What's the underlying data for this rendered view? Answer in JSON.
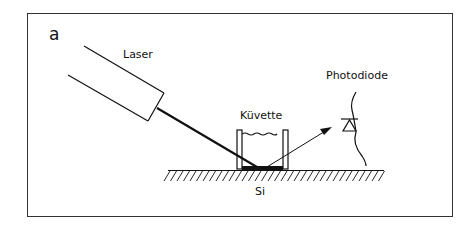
{
  "panel_label": "a",
  "labels": {
    "laser": "Laser",
    "cuvette": "Küvette",
    "photodiode": "Photodiode",
    "substrate": "Si"
  },
  "colors": {
    "line": "#111111",
    "background": "#ffffff"
  }
}
